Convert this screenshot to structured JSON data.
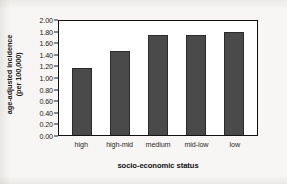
{
  "chart_data": {
    "type": "bar",
    "title": "",
    "subtitle": "",
    "categories": [
      "high",
      "high-mid",
      "medium",
      "mid-low",
      "low"
    ],
    "values": [
      1.16,
      1.45,
      1.73,
      1.72,
      1.78
    ],
    "xlabel": "socio-economic status",
    "ylabel_line1": "age-adjusted incidence",
    "ylabel_line2": "(per 100,000)",
    "ylim": [
      0.0,
      2.0
    ],
    "ytick_step": 0.2,
    "yticks": [
      "0.00",
      "0.20",
      "0.40",
      "0.60",
      "0.80",
      "1.00",
      "1.20",
      "1.40",
      "1.60",
      "1.80",
      "2.00"
    ],
    "grid": false,
    "legend": false,
    "legend_position": "none",
    "bar_color": "#4a4a4a",
    "bar_edge_color": "#2b2b2b",
    "axis_color": "#111111",
    "plot_background": "#ffffff"
  }
}
